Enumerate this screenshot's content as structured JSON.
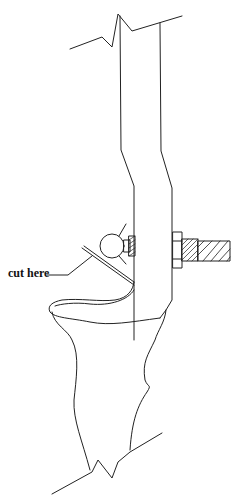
{
  "diagram": {
    "type": "technical line drawing",
    "stroke_color": "#222222",
    "background": "#ffffff",
    "labels": {
      "cut_label": "cut here"
    },
    "parts": [
      "break-line-top",
      "rod",
      "hook",
      "ball",
      "nut",
      "threaded-shaft",
      "hatched-rod",
      "cut-line",
      "post",
      "break-line-bottom"
    ]
  }
}
